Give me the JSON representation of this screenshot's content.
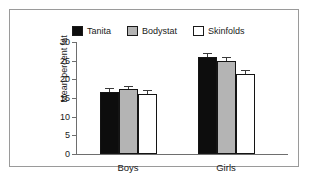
{
  "chart_data": {
    "type": "bar",
    "title": "",
    "xlabel": "",
    "ylabel": "Mean percent fat",
    "ylim": [
      0,
      30
    ],
    "yticks": [
      0,
      5,
      10,
      15,
      20,
      25,
      30
    ],
    "ytick_labels": [
      "0",
      "5",
      "10",
      "15",
      "20",
      "25",
      "30"
    ],
    "grid": false,
    "legend_position": "top",
    "categories": [
      "Boys",
      "Girls"
    ],
    "series": [
      {
        "name": "Tanita",
        "color": "#0d0d0d",
        "swatch": "sw-black",
        "values": [
          16.7,
          26.0
        ],
        "errors": [
          0.9,
          1.1
        ]
      },
      {
        "name": "Bodystat",
        "color": "#b4b4b4",
        "swatch": "sw-gray",
        "values": [
          17.3,
          24.9
        ],
        "errors": [
          0.9,
          1.0
        ]
      },
      {
        "name": "Skinfolds",
        "color": "#ffffff",
        "swatch": "sw-white",
        "values": [
          16.1,
          21.4
        ],
        "errors": [
          1.0,
          1.0
        ]
      }
    ]
  },
  "figure": {
    "frame_color": "#9a9a9a",
    "axis_color": "#6e6e6e",
    "text_color": "#1a1a1a",
    "background": "#ffffff"
  }
}
